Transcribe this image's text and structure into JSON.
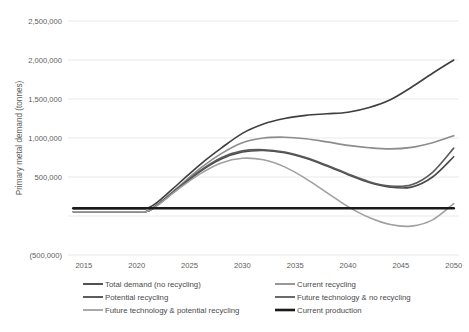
{
  "chart_data": {
    "type": "line",
    "title": "",
    "xlabel": "",
    "ylabel": "Primary metal demand (tonnes)",
    "x": [
      2015,
      2020,
      2025,
      2030,
      2035,
      2040,
      2045,
      2050
    ],
    "xlim": [
      2013.5,
      2050.5
    ],
    "ylim": [
      -500000,
      2500000
    ],
    "yticks": [
      -500000,
      0,
      500000,
      1000000,
      1500000,
      2000000,
      2500000
    ],
    "ytick_labels": [
      "(500,000)",
      "",
      "500,000",
      "1,000,000",
      "1,500,000",
      "2,000,000",
      "2,500,000"
    ],
    "xtick_labels": [
      "2015",
      "2020",
      "2025",
      "2030",
      "2035",
      "2040",
      "2045",
      "2050"
    ],
    "grid": true,
    "legend_position": "bottom",
    "series": [
      {
        "name": "Total demand (no recycling)",
        "color": "#3f3f3f",
        "width": 1.6,
        "x": [
          2014,
          2016,
          2018,
          2020,
          2021,
          2022,
          2024,
          2026,
          2028,
          2030,
          2032,
          2034,
          2036,
          2038,
          2040,
          2042,
          2044,
          2046,
          2048,
          2050
        ],
        "values": [
          95000,
          95000,
          95000,
          95000,
          100000,
          180000,
          420000,
          660000,
          870000,
          1060000,
          1180000,
          1250000,
          1290000,
          1310000,
          1330000,
          1390000,
          1490000,
          1650000,
          1830000,
          2000000
        ]
      },
      {
        "name": "Current recycling",
        "color": "#8c8c8c",
        "width": 1.6,
        "x": [
          2014,
          2016,
          2018,
          2020,
          2021,
          2022,
          2024,
          2026,
          2028,
          2030,
          2032,
          2034,
          2036,
          2038,
          2040,
          2042,
          2044,
          2046,
          2048,
          2050
        ],
        "values": [
          55000,
          55000,
          55000,
          55000,
          60000,
          150000,
          380000,
          610000,
          800000,
          940000,
          1000000,
          1010000,
          990000,
          950000,
          905000,
          875000,
          860000,
          880000,
          940000,
          1030000
        ]
      },
      {
        "name": "Potential recycling",
        "color": "#4a4a4a",
        "width": 1.6,
        "x": [
          2014,
          2016,
          2018,
          2020,
          2021,
          2022,
          2024,
          2026,
          2028,
          2030,
          2032,
          2034,
          2036,
          2038,
          2040,
          2042,
          2044,
          2046,
          2048,
          2050
        ],
        "values": [
          55000,
          55000,
          55000,
          55000,
          60000,
          145000,
          360000,
          570000,
          730000,
          820000,
          840000,
          810000,
          740000,
          640000,
          530000,
          430000,
          370000,
          370000,
          500000,
          760000
        ]
      },
      {
        "name": "Future technology & no recycling",
        "color": "#5a5a5a",
        "width": 1.6,
        "x": [
          2014,
          2016,
          2018,
          2020,
          2021,
          2022,
          2024,
          2026,
          2028,
          2030,
          2032,
          2034,
          2036,
          2038,
          2040,
          2042,
          2044,
          2046,
          2048,
          2050
        ],
        "values": [
          55000,
          55000,
          55000,
          55000,
          60000,
          148000,
          368000,
          582000,
          748000,
          835000,
          850000,
          820000,
          750000,
          650000,
          540000,
          440000,
          385000,
          400000,
          560000,
          870000
        ]
      },
      {
        "name": "Future technology & potential recycling",
        "color": "#a0a0a0",
        "width": 1.6,
        "x": [
          2014,
          2016,
          2018,
          2020,
          2021,
          2022,
          2024,
          2026,
          2028,
          2030,
          2032,
          2034,
          2036,
          2038,
          2040,
          2042,
          2044,
          2046,
          2048,
          2050
        ],
        "values": [
          55000,
          55000,
          55000,
          55000,
          60000,
          140000,
          350000,
          540000,
          680000,
          740000,
          720000,
          630000,
          480000,
          300000,
          120000,
          -20000,
          -110000,
          -130000,
          -50000,
          160000
        ]
      },
      {
        "name": "Current production",
        "color": "#1a1a1a",
        "width": 2.6,
        "x": [
          2014,
          2050
        ],
        "values": [
          100000,
          100000
        ]
      }
    ]
  },
  "legend": {
    "items": [
      {
        "label": "Total demand (no recycling)",
        "color": "#3f3f3f",
        "column": 0
      },
      {
        "label": "Current recycling",
        "color": "#8c8c8c",
        "column": 1
      },
      {
        "label": "Potential recycling",
        "color": "#4a4a4a",
        "column": 0
      },
      {
        "label": "Future technology & no recycling",
        "color": "#5a5a5a",
        "column": 1
      },
      {
        "label": "Future technology & potential recycling",
        "color": "#a0a0a0",
        "column": 0
      },
      {
        "label": "Current production",
        "color": "#1a1a1a",
        "column": 1
      }
    ]
  },
  "colors": {
    "background": "#ffffff",
    "gridline": "#e3e3e3",
    "text": "#5c5c5c"
  }
}
